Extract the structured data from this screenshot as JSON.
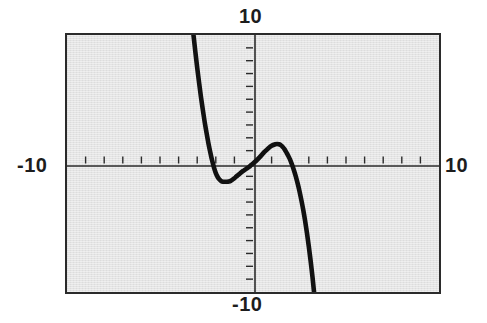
{
  "figure": {
    "name": "graphing-calculator-cubic-plot",
    "background_color": "#ffffff",
    "plot_fill_color": "#e4e4e4",
    "frame_color": "#2b2b2b",
    "curve_color": "#111111"
  },
  "labels": {
    "top": "10",
    "bottom": "-10",
    "left": "-10",
    "right": "10"
  },
  "chart_data": {
    "type": "line",
    "title": "",
    "xlabel": "",
    "ylabel": "",
    "xlim": [
      -10,
      10
    ],
    "ylim": [
      -10,
      10
    ],
    "grid": false,
    "legend": "none",
    "x_tick_interval": 1,
    "y_tick_interval": 1,
    "x_tick_labels": [
      "-10",
      "10"
    ],
    "y_tick_labels": [
      "-10",
      "10"
    ],
    "axis_tick_direction": {
      "x_axis": "up",
      "y_axis": "left"
    },
    "series": [
      {
        "name": "cubic",
        "description": "negative-leading cubic, decreasing overall with one local minimum and one local maximum near the origin",
        "roots_x": [
          -2.3,
          0.2,
          2.2
        ],
        "local_minimum": [
          -1.3,
          -1.4
        ],
        "local_maximum": [
          1.3,
          1.5
        ],
        "enters_plot_at": [
          -3.2,
          10
        ],
        "exits_plot_at": [
          3.2,
          -10
        ],
        "points": [
          [
            -3.2,
            10.0
          ],
          [
            -3.1,
            8.7
          ],
          [
            -3.0,
            7.45
          ],
          [
            -2.9,
            6.3
          ],
          [
            -2.8,
            5.2
          ],
          [
            -2.7,
            4.2
          ],
          [
            -2.6,
            3.25
          ],
          [
            -2.5,
            2.4
          ],
          [
            -2.4,
            1.6
          ],
          [
            -2.3,
            0.9
          ],
          [
            -2.2,
            0.25
          ],
          [
            -2.1,
            -0.3
          ],
          [
            -2.0,
            -0.75
          ],
          [
            -1.9,
            -1.05
          ],
          [
            -1.8,
            -1.25
          ],
          [
            -1.7,
            -1.38
          ],
          [
            -1.6,
            -1.42
          ],
          [
            -1.5,
            -1.42
          ],
          [
            -1.4,
            -1.42
          ],
          [
            -1.3,
            -1.4
          ],
          [
            -1.2,
            -1.35
          ],
          [
            -1.1,
            -1.25
          ],
          [
            -1.0,
            -1.15
          ],
          [
            -0.9,
            -1.02
          ],
          [
            -0.8,
            -0.9
          ],
          [
            -0.7,
            -0.78
          ],
          [
            -0.6,
            -0.65
          ],
          [
            -0.5,
            -0.55
          ],
          [
            -0.4,
            -0.45
          ],
          [
            -0.3,
            -0.35
          ],
          [
            -0.2,
            -0.25
          ],
          [
            -0.1,
            -0.12
          ],
          [
            0.0,
            0.0
          ],
          [
            0.2,
            0.25
          ],
          [
            0.4,
            0.55
          ],
          [
            0.6,
            0.88
          ],
          [
            0.8,
            1.15
          ],
          [
            1.0,
            1.38
          ],
          [
            1.2,
            1.5
          ],
          [
            1.3,
            1.52
          ],
          [
            1.4,
            1.5
          ],
          [
            1.5,
            1.42
          ],
          [
            1.6,
            1.28
          ],
          [
            1.7,
            1.1
          ],
          [
            1.8,
            0.85
          ],
          [
            1.9,
            0.58
          ],
          [
            2.0,
            0.28
          ],
          [
            2.1,
            -0.1
          ],
          [
            2.2,
            -0.52
          ],
          [
            2.3,
            -1.0
          ],
          [
            2.4,
            -1.55
          ],
          [
            2.5,
            -2.15
          ],
          [
            2.6,
            -2.85
          ],
          [
            2.7,
            -3.6
          ],
          [
            2.8,
            -4.45
          ],
          [
            2.9,
            -5.4
          ],
          [
            3.0,
            -6.45
          ],
          [
            3.1,
            -7.6
          ],
          [
            3.2,
            -8.85
          ],
          [
            3.28,
            -10.0
          ]
        ]
      }
    ]
  }
}
